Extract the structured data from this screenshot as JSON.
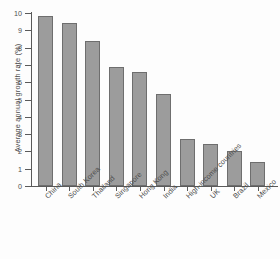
{
  "chart_data": {
    "type": "bar",
    "title": "",
    "xlabel": "",
    "ylabel": "Average annual growth rate (%)",
    "ylim": [
      0,
      10
    ],
    "ytick_labels": [
      "10",
      "9",
      "8",
      "7",
      "6",
      "5",
      "4",
      "3",
      "2",
      "1",
      "0"
    ],
    "ytick_values": [
      10,
      9,
      8,
      7,
      6,
      5,
      4,
      3,
      2,
      1,
      0
    ],
    "grid": false,
    "legend": null,
    "categories": [
      "China",
      "South Korea",
      "Thailand",
      "Singapore",
      "Hong Kong",
      "India",
      "High-income countries",
      "UK",
      "Brazil",
      "Mexico"
    ],
    "values": [
      9.8,
      9.4,
      8.4,
      6.9,
      6.6,
      5.3,
      2.7,
      2.4,
      2.0,
      1.4
    ],
    "bar_color": "#9c9c9c",
    "bar_edge_color": "#6e6e6e",
    "axis_color": "#5a5a5a",
    "text_color": "#4d4d4d",
    "background_color": "#fdfdfd"
  }
}
